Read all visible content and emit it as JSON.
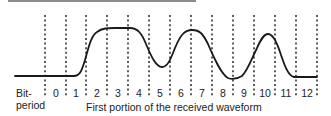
{
  "diagram": {
    "axis_label_line1": "Bit-",
    "axis_label_line2": "period",
    "caption": "First portion of the received waveform",
    "bit_periods": [
      "0",
      "1",
      "2",
      "3",
      "4",
      "5",
      "6",
      "7",
      "8",
      "9",
      "10",
      "11",
      "12"
    ],
    "colors": {
      "waveform": "#1a1a1a",
      "dashed_lines": "#333333",
      "top_rule": "#8c8c8c",
      "text": "#222222"
    }
  }
}
